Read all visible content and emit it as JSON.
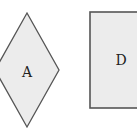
{
  "diagram": {
    "background": "#ffffff",
    "stroke_color": "#555555",
    "fill_color": "#ececec",
    "nodes": [
      {
        "id": "A",
        "label": "A",
        "shape": "diamond",
        "points": "27,13 59,70 27,127 -5,70",
        "label_x": 27,
        "label_y": 73
      },
      {
        "id": "D",
        "label": "D",
        "shape": "rectangle",
        "x": 90,
        "y": 12,
        "width": 60,
        "height": 96,
        "label_x": 121,
        "label_y": 61
      }
    ]
  }
}
